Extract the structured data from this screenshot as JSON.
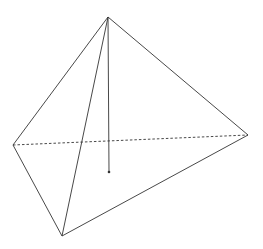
{
  "diagram": {
    "type": "pyramid",
    "background": "#ffffff",
    "stroke_color": "#333333",
    "points": {
      "apex": [
        108,
        17
      ],
      "left": [
        13,
        145
      ],
      "bottom": [
        62,
        236
      ],
      "right": [
        248,
        135
      ],
      "foot": [
        109,
        172
      ]
    },
    "solid_edges": [
      [
        "apex",
        "left"
      ],
      [
        "apex",
        "bottom"
      ],
      [
        "apex",
        "right"
      ],
      [
        "left",
        "bottom"
      ],
      [
        "bottom",
        "right"
      ],
      [
        "apex",
        "foot"
      ]
    ],
    "dashed_edges": [
      [
        "left",
        "right"
      ]
    ],
    "marked_points": [
      "foot"
    ]
  }
}
